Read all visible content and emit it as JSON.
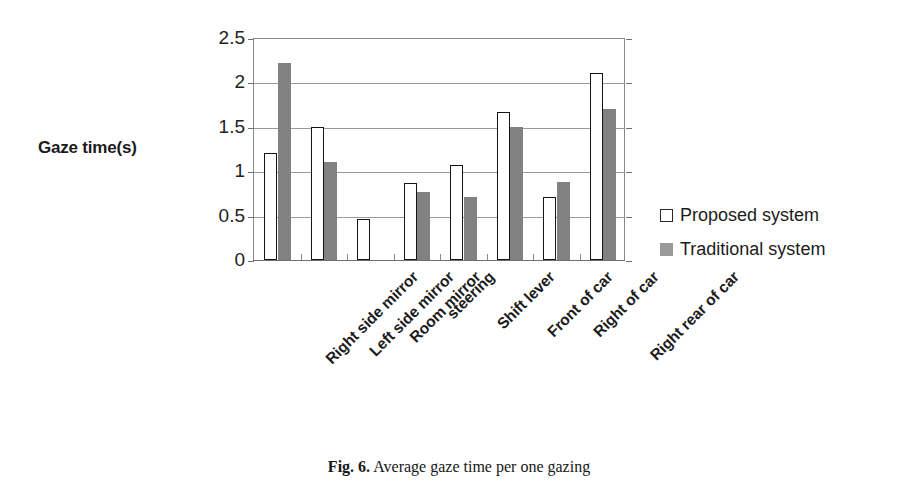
{
  "figure": {
    "caption_label": "Fig. 6.",
    "caption_text": "Average gaze time per one gazing"
  },
  "chart_data": {
    "type": "bar",
    "title": "",
    "xlabel": "",
    "ylabel": "Gaze time(s)",
    "ylim": [
      0,
      2.5
    ],
    "ytick_labels": [
      "2.5",
      "2",
      "1.5",
      "1",
      "0.5",
      "0"
    ],
    "yticks": [
      2.5,
      2,
      1.5,
      1,
      0.5,
      0
    ],
    "grid": true,
    "grid_axis": "y",
    "legend_position": "right",
    "categories": [
      "Right side mirror",
      "Left side mirror",
      "Room mirror",
      "steering",
      "Shift lever",
      "Front of car",
      "Right of car",
      "Right rear of car"
    ],
    "series": [
      {
        "name": "Proposed system",
        "color": "#ffffff",
        "edge_color": "#141414",
        "values": [
          1.2,
          1.5,
          0.46,
          0.87,
          1.07,
          1.67,
          0.71,
          2.11
        ]
      },
      {
        "name": "Traditional system",
        "color": "#818181",
        "edge_color": "#818181",
        "values": [
          2.22,
          1.1,
          0,
          0.77,
          0.71,
          1.5,
          0.88,
          1.7
        ]
      }
    ]
  }
}
